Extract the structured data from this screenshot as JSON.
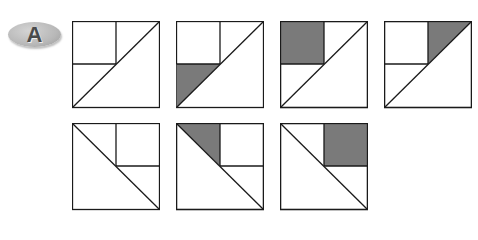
{
  "badge": {
    "label": "A",
    "color": "#b8b8b8",
    "text_color": "#4a4a4a"
  },
  "colors": {
    "stroke": "#1a1a1a",
    "fill_shaded": "#7a7a7a",
    "fill_blank": "#ffffff"
  },
  "figures": [
    {
      "id": 1,
      "row": 1,
      "diagonal": "bottom-left-to-top-right",
      "shaded": "none"
    },
    {
      "id": 2,
      "row": 1,
      "diagonal": "bottom-left-to-top-right",
      "shaded": "bottom-left-triangle"
    },
    {
      "id": 3,
      "row": 1,
      "diagonal": "bottom-left-to-top-right",
      "shaded": "top-left-square"
    },
    {
      "id": 4,
      "row": 1,
      "diagonal": "bottom-left-to-top-right",
      "shaded": "top-right-triangle"
    },
    {
      "id": 5,
      "row": 2,
      "diagonal": "top-left-to-bottom-right",
      "shaded": "none"
    },
    {
      "id": 6,
      "row": 2,
      "diagonal": "top-left-to-bottom-right",
      "shaded": "top-left-triangle"
    },
    {
      "id": 7,
      "row": 2,
      "diagonal": "top-left-to-bottom-right",
      "shaded": "top-right-square"
    }
  ]
}
